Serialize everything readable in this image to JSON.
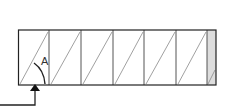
{
  "diagram": {
    "box": {
      "x": 18,
      "y": 30,
      "width": 198,
      "height": 55
    },
    "dividers_x": [
      49,
      81,
      113,
      144,
      176,
      207
    ],
    "end_panel": {
      "x": 207,
      "width": 9,
      "fill": "#dddddd"
    },
    "angle_label": "A",
    "colors": {
      "stroke": "#222222",
      "hatch": "#777777",
      "shaded": "#dddddd"
    },
    "arrow": {
      "start_x": 0,
      "start_y": 105,
      "corner_x": 35,
      "tip_y": 86
    }
  }
}
